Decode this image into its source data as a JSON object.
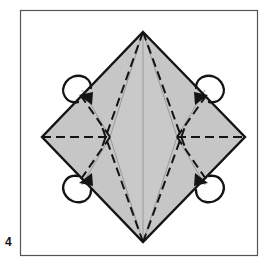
{
  "figure": {
    "step_label": "4",
    "caption_position": "bottom-left-outside-frame",
    "type": "origami-fold-diagram",
    "frame": {
      "border_color": "#4a4a4a",
      "fill_color": "#ffffff",
      "x": 20,
      "y": 10,
      "width": 238,
      "height": 246
    },
    "paper": {
      "fill_color": "#c6c6c6",
      "outline_color": "#141414",
      "shape": "diamond",
      "vertices": {
        "top": {
          "x": 143,
          "y": 32
        },
        "left": {
          "x": 42,
          "y": 137
        },
        "right": {
          "x": 245,
          "y": 137
        },
        "bottom": {
          "x": 143,
          "y": 242
        }
      }
    },
    "crease_lines": {
      "valley_fold_color": "#141414",
      "valley_fold_style": "dashed",
      "existing_crease_color": "#8e8e8e",
      "existing_crease_style": "solid",
      "crossing_points": [
        {
          "x": 110,
          "y": 137
        },
        {
          "x": 177,
          "y": 137
        }
      ],
      "horizontal_dashed_axis_y": 137,
      "center_vertical_x": 143
    },
    "arrows": [
      {
        "id": "arrow-top-left",
        "position": "upper-left-edge",
        "cx": 78,
        "cy": 96,
        "direction": "fold-inward-down-right",
        "color": "#141414"
      },
      {
        "id": "arrow-top-right",
        "position": "upper-right-edge",
        "cx": 208,
        "cy": 96,
        "direction": "fold-inward-down-left",
        "color": "#141414"
      },
      {
        "id": "arrow-bottom-left",
        "position": "lower-left-edge",
        "cx": 78,
        "cy": 180,
        "direction": "fold-inward-up-right",
        "color": "#141414"
      },
      {
        "id": "arrow-bottom-right",
        "position": "lower-right-edge",
        "cx": 208,
        "cy": 180,
        "direction": "fold-inward-up-left",
        "color": "#141414"
      }
    ]
  }
}
